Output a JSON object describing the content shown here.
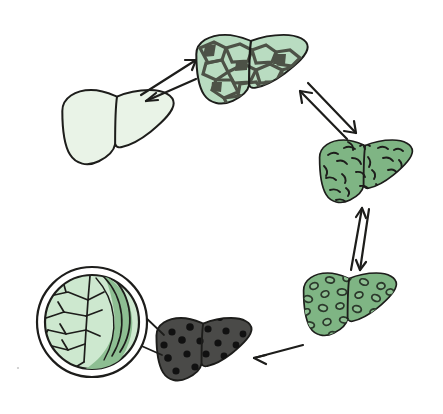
{
  "diagram": {
    "title": "Liver Disease Progression Cycle",
    "type": "medical-illustration",
    "background_color": "#ffffff",
    "ink_color": "#1d1d1b",
    "width": 443,
    "height": 414,
    "layout": "circular-clockwise"
  },
  "stages": [
    {
      "id": "healthy-liver",
      "label": "Healthy liver",
      "order": 1,
      "position": "left",
      "fill_color": "#e9f3e7",
      "texture": "none",
      "texture_color": "",
      "cx": 118,
      "cy": 128
    },
    {
      "id": "fatty-liver",
      "label": "Fatty liver",
      "order": 2,
      "position": "top",
      "fill_color": "#b9dcc1",
      "texture": "mosaic-cracked-patches",
      "texture_color": "#4d5247",
      "cx": 252,
      "cy": 70
    },
    {
      "id": "inflamed-liver",
      "label": "Liver inflammation",
      "order": 3,
      "position": "right-upper",
      "fill_color": "#7fb584",
      "texture": "short-curved-dashes",
      "texture_color": "#1d1d1b",
      "cx": 366,
      "cy": 172
    },
    {
      "id": "cirrhotic-liver",
      "label": "Cirrhotic liver",
      "order": 4,
      "position": "right-lower",
      "fill_color": "#7fb584",
      "texture": "outlined-oval-nodules",
      "texture_color": "#2c3a2c",
      "cx": 350,
      "cy": 305
    },
    {
      "id": "end-stage-liver",
      "label": "End-stage liver with tumour nodules",
      "order": 5,
      "position": "bottom",
      "fill_color": "#4a4a48",
      "texture": "solid-black-dots",
      "texture_color": "#111111",
      "cx": 204,
      "cy": 350
    }
  ],
  "inset": {
    "id": "magnified-inset",
    "label": "Magnified cross-section of liver tissue",
    "shape": "double-ring-circle",
    "fill_color": "#cde8cf",
    "shade_color": "#8dbe92",
    "ring_color": "#1d1d1b",
    "cx": 92,
    "cy": 322,
    "outer_radius": 56,
    "inner_radius": 48,
    "source_stage": "end-stage-liver"
  },
  "connectors": [
    {
      "id": "arrow-healthy-to-fatty",
      "from": "healthy-liver",
      "to": "fatty-liver",
      "style": "bidirectional-pair",
      "reversible": true
    },
    {
      "id": "arrow-fatty-to-inflamed",
      "from": "fatty-liver",
      "to": "inflamed-liver",
      "style": "bidirectional-pair",
      "reversible": true
    },
    {
      "id": "arrow-inflamed-to-cirrhotic",
      "from": "inflamed-liver",
      "to": "cirrhotic-liver",
      "style": "bidirectional-pair",
      "reversible": true
    },
    {
      "id": "arrow-cirrhotic-to-endstage",
      "from": "cirrhotic-liver",
      "to": "end-stage-liver",
      "style": "single-arrow",
      "reversible": false
    },
    {
      "id": "callout-endstage-to-inset",
      "from": "end-stage-liver",
      "to": "magnified-inset",
      "style": "callout-lines",
      "reversible": false
    }
  ],
  "artifacts": [
    {
      "id": "speck",
      "label": "scan speck",
      "x": 18,
      "y": 368
    }
  ]
}
